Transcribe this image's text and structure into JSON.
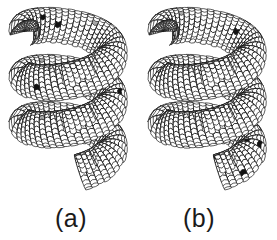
{
  "figure": {
    "background_color": "#ffffff",
    "width": 277,
    "height": 240
  },
  "panels": [
    {
      "id": "a",
      "caption": "(a)",
      "object": "helically coiled carbon nanotube",
      "turns": 3,
      "handedness": "left-to-right downward spiral",
      "cap": "closed rounded cap at upper-left end",
      "mesh": {
        "lattice": "hexagonal graphitic network",
        "line_color": "#161616",
        "face_color": "#ffffff",
        "line_width": 0.9
      },
      "defects": {
        "pentagon_color": "#121212",
        "pentagon_label": "pentagon (dark)",
        "pentagon_count": 9,
        "heptagon_color": "#a9a9a9",
        "heptagon_label": "heptagon (gray)",
        "heptagon_count": 5
      }
    },
    {
      "id": "b",
      "caption": "(b)",
      "object": "helically coiled carbon nanotube",
      "turns": 3,
      "handedness": "left-to-right downward spiral",
      "cap": "closed rounded cap at upper-left end",
      "mesh": {
        "lattice": "hexagonal graphitic network",
        "line_color": "#161616",
        "face_color": "#ffffff",
        "line_width": 0.9
      },
      "defects": {
        "pentagon_color": "#121212",
        "pentagon_label": "pentagon (dark)",
        "pentagon_count": 10,
        "heptagon_color": "#a9a9a9",
        "heptagon_label": "heptagon (gray)",
        "heptagon_count": 5
      }
    }
  ],
  "colors": {
    "background": "#ffffff",
    "outline": "#161616",
    "pentagon": "#121212",
    "heptagon": "#a9a9a9",
    "caption_text": "#1a1a1a"
  },
  "chart_data": {
    "type": "diagram",
    "panels": [
      "(a)",
      "(b)"
    ],
    "series": [
      {
        "name": "(a) pentagons",
        "values": [
          9
        ]
      },
      {
        "name": "(a) heptagons",
        "values": [
          5
        ]
      },
      {
        "name": "(b) pentagons",
        "values": [
          10
        ]
      },
      {
        "name": "(b) heptagons",
        "values": [
          5
        ]
      }
    ]
  }
}
